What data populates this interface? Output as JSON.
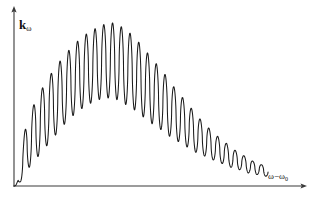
{
  "figure": {
    "axis_color": "#3a3a3a",
    "curve_color": "#1a1a1a",
    "background": "#ffffff",
    "y_axis_label_main": "k",
    "y_axis_label_sub": "ω",
    "x_axis_label_main": "ω−ω",
    "x_axis_label_sub": "0"
  },
  "chart_data": {
    "type": "line",
    "title": "",
    "subtitle": "",
    "xlabel": "ω−ω₀",
    "ylabel": "kω",
    "grid": false,
    "legend": "none",
    "axis_arrows": true,
    "tick_labels_x": [],
    "tick_labels_y": [],
    "xlim": [
      0,
      1
    ],
    "ylim": [
      0,
      1
    ],
    "series": [
      {
        "name": "k_omega",
        "n_oscillations": 29,
        "x": [
          0.0,
          0.01,
          0.02,
          0.03,
          0.04,
          0.05,
          0.06,
          0.07,
          0.08,
          0.09,
          0.1,
          0.11,
          0.12,
          0.13,
          0.14,
          0.15,
          0.16,
          0.17,
          0.18,
          0.19,
          0.2,
          0.21,
          0.22,
          0.23,
          0.24,
          0.25,
          0.26,
          0.27,
          0.28,
          0.29,
          0.3,
          0.31,
          0.32,
          0.33,
          0.34,
          0.35,
          0.36,
          0.37,
          0.38,
          0.39,
          0.4,
          0.41,
          0.42,
          0.43,
          0.44,
          0.45,
          0.46,
          0.47,
          0.48,
          0.49,
          0.5,
          0.51,
          0.52,
          0.53,
          0.54,
          0.55,
          0.56,
          0.57,
          0.58,
          0.59,
          0.6,
          0.61,
          0.62,
          0.63,
          0.64,
          0.65,
          0.66,
          0.67,
          0.68,
          0.69,
          0.7,
          0.71,
          0.72,
          0.73,
          0.74,
          0.75,
          0.76,
          0.77,
          0.78,
          0.79,
          0.8,
          0.81,
          0.82,
          0.83,
          0.84,
          0.85,
          0.86,
          0.87,
          0.88,
          0.89,
          0.9,
          0.91,
          0.92,
          0.93,
          0.94,
          0.95,
          0.96,
          0.97,
          0.98,
          0.99,
          1.0
        ],
        "envelope_upper": [
          0.0,
          0.12,
          0.21,
          0.28,
          0.34,
          0.39,
          0.44,
          0.48,
          0.52,
          0.55,
          0.58,
          0.61,
          0.64,
          0.67,
          0.69,
          0.72,
          0.74,
          0.76,
          0.78,
          0.8,
          0.82,
          0.84,
          0.86,
          0.87,
          0.89,
          0.9,
          0.92,
          0.93,
          0.94,
          0.95,
          0.96,
          0.97,
          0.98,
          0.99,
          0.99,
          1.0,
          1.0,
          1.0,
          1.0,
          0.99,
          0.98,
          0.97,
          0.96,
          0.95,
          0.93,
          0.92,
          0.9,
          0.88,
          0.86,
          0.84,
          0.82,
          0.8,
          0.78,
          0.76,
          0.74,
          0.72,
          0.7,
          0.68,
          0.66,
          0.64,
          0.61,
          0.59,
          0.57,
          0.55,
          0.53,
          0.51,
          0.49,
          0.47,
          0.45,
          0.43,
          0.41,
          0.39,
          0.38,
          0.36,
          0.34,
          0.33,
          0.31,
          0.3,
          0.28,
          0.27,
          0.26,
          0.24,
          0.23,
          0.22,
          0.21,
          0.2,
          0.19,
          0.18,
          0.17,
          0.16,
          0.15,
          0.15,
          0.14,
          0.13,
          0.13,
          0.12,
          0.11,
          0.11,
          0.1,
          0.1,
          0.09
        ],
        "envelope_lower": [
          0.0,
          0.02,
          0.04,
          0.06,
          0.08,
          0.1,
          0.12,
          0.14,
          0.16,
          0.18,
          0.2,
          0.22,
          0.24,
          0.26,
          0.28,
          0.3,
          0.32,
          0.34,
          0.36,
          0.38,
          0.39,
          0.41,
          0.43,
          0.44,
          0.46,
          0.47,
          0.48,
          0.49,
          0.5,
          0.51,
          0.52,
          0.53,
          0.53,
          0.54,
          0.54,
          0.54,
          0.54,
          0.54,
          0.53,
          0.53,
          0.52,
          0.51,
          0.5,
          0.49,
          0.48,
          0.47,
          0.46,
          0.45,
          0.43,
          0.42,
          0.41,
          0.4,
          0.38,
          0.37,
          0.36,
          0.35,
          0.33,
          0.32,
          0.31,
          0.3,
          0.29,
          0.28,
          0.27,
          0.26,
          0.25,
          0.24,
          0.23,
          0.22,
          0.21,
          0.2,
          0.19,
          0.19,
          0.18,
          0.17,
          0.16,
          0.16,
          0.15,
          0.14,
          0.14,
          0.13,
          0.12,
          0.12,
          0.11,
          0.11,
          0.1,
          0.1,
          0.09,
          0.09,
          0.08,
          0.08,
          0.08,
          0.07,
          0.07,
          0.06,
          0.06,
          0.06,
          0.05,
          0.05,
          0.05,
          0.04,
          0.04
        ],
        "peak_x": 0.375,
        "peak_y": 1.0,
        "start_x": 0.0,
        "start_y": 0.0,
        "end_x": 0.955,
        "end_y": 0.05
      }
    ]
  }
}
